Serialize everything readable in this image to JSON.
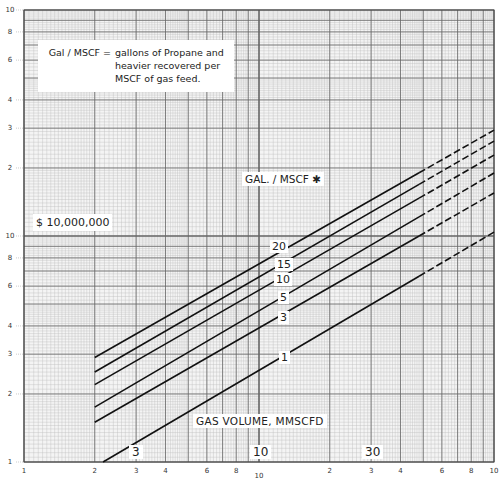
{
  "chart_data": {
    "type": "line",
    "title": "",
    "xlabel": "GAS VOLUME, MMSCFD",
    "ylabel": "$ 10,000,000",
    "x_scale": "log",
    "y_scale": "log",
    "xlim": [
      1,
      100
    ],
    "ylim": [
      1,
      100
    ],
    "grid": true,
    "x_tick_labels": [
      "1",
      "2",
      "3",
      "4",
      "6",
      "8",
      "10",
      "2",
      "3",
      "4",
      "6",
      "8",
      "10"
    ],
    "y_tick_labels": [
      "10",
      "8",
      "6",
      "4",
      "3",
      "2",
      "10",
      "8",
      "6",
      "4",
      "3",
      "2",
      "1"
    ],
    "in_plot_x_labels": [
      "3",
      "10",
      "30"
    ],
    "legend_title": "GAL. / MSCF *",
    "annotation": "Gal / MSCF = gallons of Propane and heavier recovered per MSCF of gas feed.",
    "solid_until_x": 48,
    "series": [
      {
        "name": "20",
        "x": [
          2,
          100
        ],
        "y": [
          2.9,
          29.4
        ]
      },
      {
        "name": "15",
        "x": [
          2,
          100
        ],
        "y": [
          2.5,
          26.3
        ]
      },
      {
        "name": "10",
        "x": [
          2,
          100
        ],
        "y": [
          2.2,
          22.8
        ]
      },
      {
        "name": "5",
        "x": [
          2,
          100
        ],
        "y": [
          1.75,
          19.0
        ]
      },
      {
        "name": "3",
        "x": [
          2,
          100
        ],
        "y": [
          1.5,
          15.5
        ]
      },
      {
        "name": "1",
        "x": [
          2.17,
          100
        ],
        "y": [
          1.0,
          10.4
        ]
      }
    ]
  },
  "labels": {
    "note_lhs": "Gal / MSCF =",
    "note_rhs": "gallons of Propane and\nheavier recovered per\nMSCF of gas feed.",
    "unit": "$ 10,000,000",
    "series_title": "GAL. / MSCF ✱",
    "x_title": "GAS  VOLUME,  MMSCFD",
    "line_labels": [
      "20",
      "15",
      "10",
      "5",
      "3",
      "1"
    ],
    "decade_labels": [
      "3",
      "10",
      "30"
    ]
  }
}
